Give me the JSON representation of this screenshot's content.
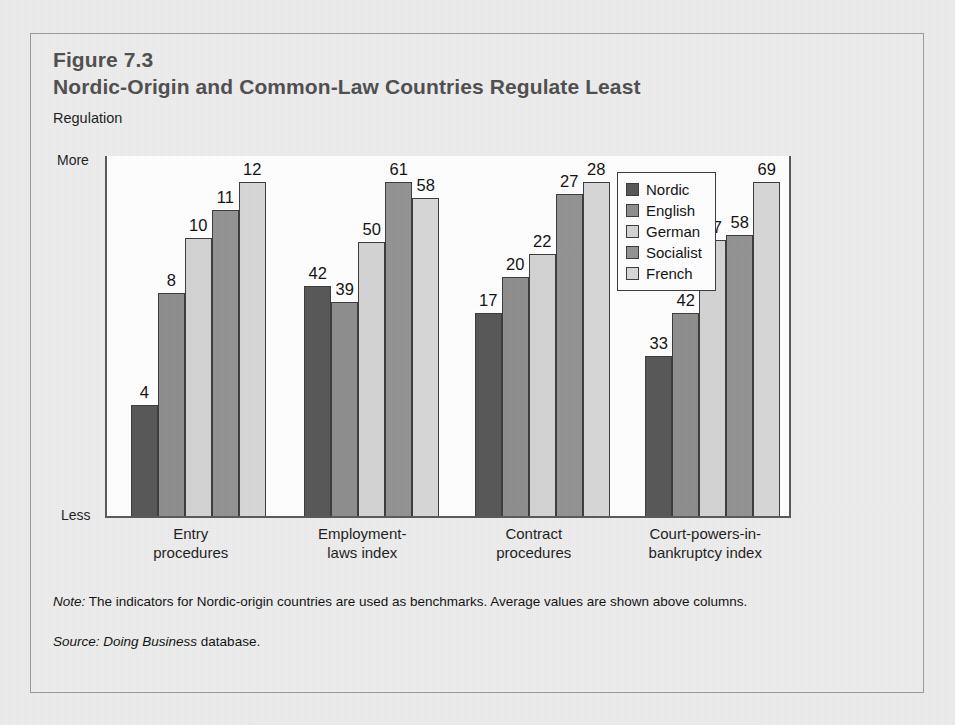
{
  "figure": {
    "number": "Figure 7.3",
    "title": "Nordic-Origin and Common-Law Countries Regulate Least"
  },
  "footnotes": {
    "note_lead": "Note:",
    "note_text": " The indicators for Nordic-origin countries are used as benchmarks. Average values are shown above columns.",
    "source_lead": "Source:",
    "source_italic": " Doing Business",
    "source_text": " database."
  },
  "colors": {
    "page_background": "#ececec",
    "frame_background": "#ededed",
    "frame_border": "#9a9a9a",
    "plot_background": "#ffffff",
    "axis": "#595959",
    "title_text": "#4f4f4f",
    "body_text": "#111111",
    "bar_outline": "#3c3c3c",
    "series_nordic": "#575757",
    "series_english": "#8e8e8e",
    "series_german": "#d3d3d3",
    "series_socialist": "#939393",
    "series_french": "#d8d8d8"
  },
  "chart_data": {
    "type": "bar",
    "title": "Nordic-Origin and Common-Law Countries Regulate Least",
    "subtitle": "Figure 7.3",
    "ylabel": "Regulation",
    "xlabel": "",
    "grid": false,
    "legend_position": "top-right",
    "y_axis_ticks": [
      "More",
      "Less"
    ],
    "y_axis_note": "Qualitative axis: each category group is scaled independently; values are labeled above columns.",
    "categories": [
      "Entry\nprocedures",
      "Employment-\nlaws index",
      "Contract\nprocedures",
      "Court-powers-in-\nbankruptcy index"
    ],
    "series": [
      {
        "name": "Nordic",
        "values": [
          4,
          42,
          17,
          33
        ]
      },
      {
        "name": "English",
        "values": [
          8,
          39,
          20,
          42
        ]
      },
      {
        "name": "German",
        "values": [
          10,
          50,
          22,
          57
        ]
      },
      {
        "name": "Socialist",
        "values": [
          11,
          61,
          27,
          58
        ]
      },
      {
        "name": "French",
        "values": [
          12,
          58,
          28,
          69
        ]
      }
    ],
    "group_max": [
      12,
      61,
      28,
      69
    ]
  },
  "axis": {
    "label_top": "More",
    "label_bottom": "Less"
  },
  "categories": [
    {
      "line1": "Entry",
      "line2": "procedures"
    },
    {
      "line1": "Employment-",
      "line2": "laws index"
    },
    {
      "line1": "Contract",
      "line2": "procedures"
    },
    {
      "line1": "Court-powers-in-",
      "line2": "bankruptcy index"
    }
  ],
  "legend": [
    {
      "label": "Nordic",
      "color": "#575757"
    },
    {
      "label": "English",
      "color": "#8e8e8e"
    },
    {
      "label": "German",
      "color": "#d3d3d3"
    },
    {
      "label": "Socialist",
      "color": "#939393"
    },
    {
      "label": "French",
      "color": "#d8d8d8"
    }
  ]
}
